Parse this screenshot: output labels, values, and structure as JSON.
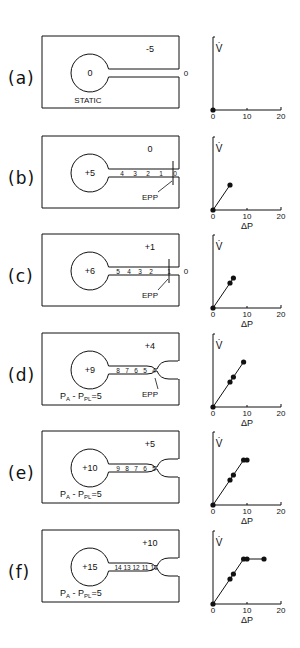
{
  "panels": [
    {
      "id": "a",
      "label": "(a)",
      "alveolar_pressure": "0",
      "pleural_pressure": "-5",
      "mouth_pressure": "0",
      "airway_pressures": [],
      "annotation": "STATIC",
      "epp_label": "",
      "pa_ppl": "",
      "flow_points": [
        [
          0,
          0
        ]
      ]
    },
    {
      "id": "b",
      "label": "(b)",
      "alveolar_pressure": "+5",
      "pleural_pressure": "0",
      "mouth_pressure": "",
      "airway_pressures": [
        "4",
        "3",
        "2",
        "1",
        "0"
      ],
      "annotation": "",
      "epp_label": "EPP",
      "pa_ppl": "",
      "flow_points": [
        [
          0,
          0
        ],
        [
          5,
          2.5
        ]
      ]
    },
    {
      "id": "c",
      "label": "(c)",
      "alveolar_pressure": "+6",
      "pleural_pressure": "+1",
      "mouth_pressure": "0",
      "airway_pressures": [
        "5",
        "4",
        "3",
        "2",
        "1"
      ],
      "annotation": "",
      "epp_label": "EPP",
      "pa_ppl": "",
      "flow_points": [
        [
          0,
          0
        ],
        [
          5,
          2.5
        ],
        [
          6,
          3
        ]
      ]
    },
    {
      "id": "d",
      "label": "(d)",
      "alveolar_pressure": "+9",
      "pleural_pressure": "+4",
      "mouth_pressure": "",
      "airway_pressures": [
        "8",
        "7",
        "6",
        "5",
        "4"
      ],
      "annotation": "",
      "epp_label": "EPP",
      "pa_ppl": "5",
      "flow_points": [
        [
          0,
          0
        ],
        [
          5,
          2.5
        ],
        [
          6,
          3
        ],
        [
          9,
          4.5
        ]
      ]
    },
    {
      "id": "e",
      "label": "(e)",
      "alveolar_pressure": "+10",
      "pleural_pressure": "+5",
      "mouth_pressure": "",
      "airway_pressures": [
        "9",
        "8",
        "7",
        "6",
        "5"
      ],
      "annotation": "",
      "epp_label": "",
      "pa_ppl": "5",
      "flow_points": [
        [
          0,
          0
        ],
        [
          5,
          2.5
        ],
        [
          6,
          3
        ],
        [
          9,
          4.5
        ],
        [
          10,
          4.5
        ]
      ]
    },
    {
      "id": "f",
      "label": "(f)",
      "alveolar_pressure": "+15",
      "pleural_pressure": "+10",
      "mouth_pressure": "",
      "airway_pressures": [
        "14",
        "13",
        "12",
        "11",
        "10"
      ],
      "annotation": "",
      "epp_label": "",
      "pa_ppl": "5",
      "flow_points": [
        [
          0,
          0
        ],
        [
          5,
          2.5
        ],
        [
          6,
          3
        ],
        [
          9,
          4.5
        ],
        [
          10,
          4.5
        ],
        [
          15,
          4.5
        ]
      ]
    }
  ],
  "axes": {
    "y_label": "V̇",
    "x_label": "ΔP",
    "x_ticks": [
      "0",
      "10",
      "20"
    ]
  },
  "pa_ppl_prefix": "PA - PPL = ",
  "chart_data": [
    {
      "type": "line",
      "title": "(a)",
      "xlabel": "ΔP",
      "ylabel": "V̇",
      "x": [
        0
      ],
      "y": [
        0
      ],
      "xlim": [
        0,
        20
      ]
    },
    {
      "type": "line",
      "title": "(b)",
      "xlabel": "ΔP",
      "ylabel": "V̇",
      "x": [
        0,
        5
      ],
      "y": [
        0,
        2.5
      ],
      "xlim": [
        0,
        20
      ]
    },
    {
      "type": "line",
      "title": "(c)",
      "xlabel": "ΔP",
      "ylabel": "V̇",
      "x": [
        0,
        5,
        6
      ],
      "y": [
        0,
        2.5,
        3
      ],
      "xlim": [
        0,
        20
      ]
    },
    {
      "type": "line",
      "title": "(d)",
      "xlabel": "ΔP",
      "ylabel": "V̇",
      "x": [
        0,
        5,
        6,
        9
      ],
      "y": [
        0,
        2.5,
        3,
        4.5
      ],
      "xlim": [
        0,
        20
      ]
    },
    {
      "type": "line",
      "title": "(e)",
      "xlabel": "ΔP",
      "ylabel": "V̇",
      "x": [
        0,
        5,
        6,
        9,
        10
      ],
      "y": [
        0,
        2.5,
        3,
        4.5,
        4.5
      ],
      "xlim": [
        0,
        20
      ]
    },
    {
      "type": "line",
      "title": "(f)",
      "xlabel": "ΔP",
      "ylabel": "V̇",
      "x": [
        0,
        5,
        6,
        9,
        10,
        15
      ],
      "y": [
        0,
        2.5,
        3,
        4.5,
        4.5,
        4.5
      ],
      "xlim": [
        0,
        20
      ]
    }
  ]
}
